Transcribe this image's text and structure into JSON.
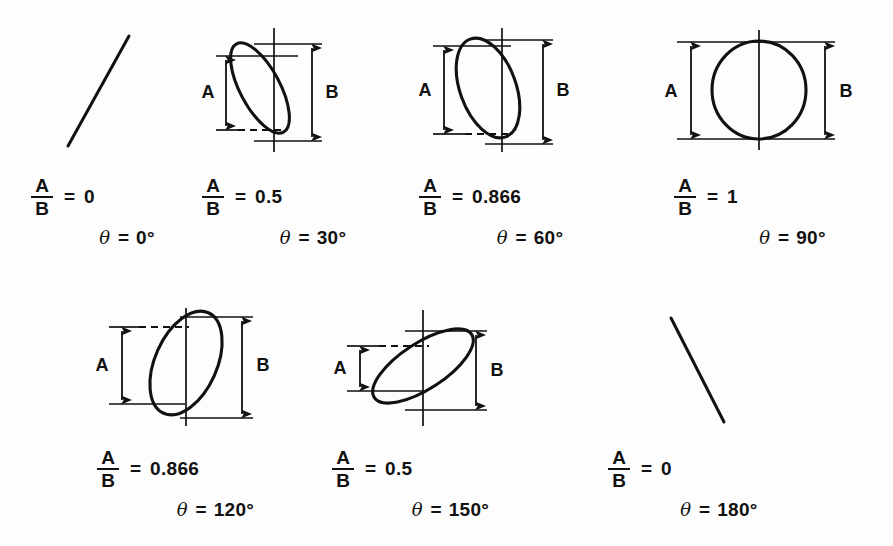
{
  "figure": {
    "background_color": "#fdfdfd",
    "ink_color": "#111111",
    "dimension_labels": {
      "a": "A",
      "b": "B"
    },
    "equals": "=",
    "theta_symbol": "θ",
    "degree_symbol": "°"
  },
  "panels": [
    {
      "id": "theta-0",
      "shape": "line",
      "slope": "positive",
      "ratio_numerator": "A",
      "ratio_denominator": "B",
      "ratio_value": "0",
      "theta_value": "0°",
      "has_dimensions": false
    },
    {
      "id": "theta-30",
      "shape": "ellipse",
      "tilt": "right",
      "ratio_numerator": "A",
      "ratio_denominator": "B",
      "ratio_value": "0.5",
      "theta_value": "30°",
      "has_dimensions": true,
      "label_a": "A",
      "label_b": "B"
    },
    {
      "id": "theta-60",
      "shape": "ellipse",
      "tilt": "right",
      "ratio_numerator": "A",
      "ratio_denominator": "B",
      "ratio_value": "0.866",
      "theta_value": "60°",
      "has_dimensions": true,
      "label_a": "A",
      "label_b": "B"
    },
    {
      "id": "theta-90",
      "shape": "circle",
      "tilt": "none",
      "ratio_numerator": "A",
      "ratio_denominator": "B",
      "ratio_value": "1",
      "theta_value": "90°",
      "has_dimensions": true,
      "label_a": "A",
      "label_b": "B"
    },
    {
      "id": "theta-120",
      "shape": "ellipse",
      "tilt": "left",
      "ratio_numerator": "A",
      "ratio_denominator": "B",
      "ratio_value": "0.866",
      "theta_value": "120°",
      "has_dimensions": true,
      "label_a": "A",
      "label_b": "B"
    },
    {
      "id": "theta-150",
      "shape": "ellipse",
      "tilt": "left",
      "ratio_numerator": "A",
      "ratio_denominator": "B",
      "ratio_value": "0.5",
      "theta_value": "150°",
      "has_dimensions": true,
      "label_a": "A",
      "label_b": "B"
    },
    {
      "id": "theta-180",
      "shape": "line",
      "slope": "negative",
      "ratio_numerator": "A",
      "ratio_denominator": "B",
      "ratio_value": "0",
      "theta_value": "180°",
      "has_dimensions": false
    }
  ]
}
